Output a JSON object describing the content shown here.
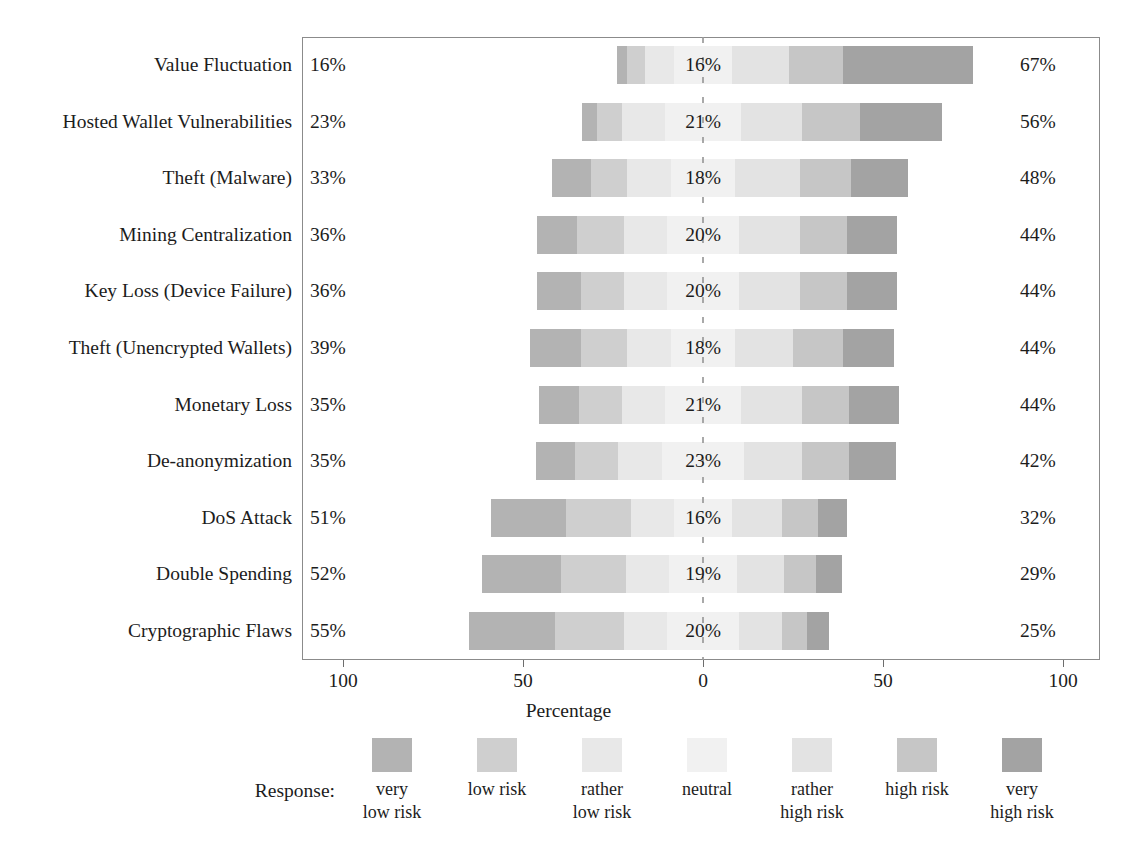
{
  "chart_data": {
    "type": "bar",
    "subtype": "diverging-stacked-likert",
    "title": "",
    "xlabel": "Percentage",
    "ylabel": "",
    "xlim": [
      -100,
      100
    ],
    "xticks": [
      100,
      50,
      0,
      50,
      100
    ],
    "xtick_labels": [
      "100",
      "50",
      "0",
      "50",
      "100"
    ],
    "grid": false,
    "legend_title": "Response:",
    "legend_position": "bottom",
    "zero_reference_line": true,
    "categories_order": [
      "very low risk",
      "low risk",
      "rather low risk",
      "neutral",
      "rather high risk",
      "high risk",
      "very high risk"
    ],
    "category_colors": [
      "#b3b3b3",
      "#cfcfcf",
      "#e8e8e8",
      "#f1f1f1",
      "#e3e3e3",
      "#c6c6c6",
      "#a3a3a3"
    ],
    "summary_columns": {
      "left": "sum of very low risk + low risk + rather low risk",
      "center": "neutral",
      "right": "sum of rather high risk + high risk + very high risk"
    },
    "categories": [
      "Value Fluctuation",
      "Hosted Wallet Vulnerabilities",
      "Theft (Malware)",
      "Mining Centralization",
      "Key Loss (Device Failure)",
      "Theft (Unencrypted Wallets)",
      "Monetary Loss",
      "De-anonymization",
      "DoS Attack",
      "Double Spending",
      "Cryptographic Flaws"
    ],
    "rows": [
      {
        "label": "Value Fluctuation",
        "left_label": "16%",
        "center_label": "16%",
        "right_label": "67%",
        "values": {
          "very low risk": 3,
          "low risk": 5,
          "rather low risk": 8,
          "neutral": 16,
          "rather high risk": 16,
          "high risk": 15,
          "very high risk": 36
        }
      },
      {
        "label": "Hosted Wallet Vulnerabilities",
        "left_label": "23%",
        "center_label": "21%",
        "right_label": "56%",
        "values": {
          "very low risk": 4,
          "low risk": 7,
          "rather low risk": 12,
          "neutral": 21,
          "rather high risk": 17,
          "high risk": 16,
          "very high risk": 23
        }
      },
      {
        "label": "Theft (Malware)",
        "left_label": "33%",
        "center_label": "18%",
        "right_label": "48%",
        "values": {
          "very low risk": 11,
          "low risk": 10,
          "rather low risk": 12,
          "neutral": 18,
          "rather high risk": 18,
          "high risk": 14,
          "very high risk": 16
        }
      },
      {
        "label": "Mining Centralization",
        "left_label": "36%",
        "center_label": "20%",
        "right_label": "44%",
        "values": {
          "very low risk": 11,
          "low risk": 13,
          "rather low risk": 12,
          "neutral": 20,
          "rather high risk": 17,
          "high risk": 13,
          "very high risk": 14
        }
      },
      {
        "label": "Key Loss (Device Failure)",
        "left_label": "36%",
        "center_label": "20%",
        "right_label": "44%",
        "values": {
          "very low risk": 12,
          "low risk": 12,
          "rather low risk": 12,
          "neutral": 20,
          "rather high risk": 17,
          "high risk": 13,
          "very high risk": 14
        }
      },
      {
        "label": "Theft (Unencrypted Wallets)",
        "left_label": "39%",
        "center_label": "18%",
        "right_label": "44%",
        "values": {
          "very low risk": 14,
          "low risk": 13,
          "rather low risk": 12,
          "neutral": 18,
          "rather high risk": 16,
          "high risk": 14,
          "very high risk": 14
        }
      },
      {
        "label": "Monetary Loss",
        "left_label": "35%",
        "center_label": "21%",
        "right_label": "44%",
        "values": {
          "very low risk": 11,
          "low risk": 12,
          "rather low risk": 12,
          "neutral": 21,
          "rather high risk": 17,
          "high risk": 13,
          "very high risk": 14
        }
      },
      {
        "label": "De-anonymization",
        "left_label": "35%",
        "center_label": "23%",
        "right_label": "42%",
        "values": {
          "very low risk": 11,
          "low risk": 12,
          "rather low risk": 12,
          "neutral": 23,
          "rather high risk": 16,
          "high risk": 13,
          "very high risk": 13
        }
      },
      {
        "label": "DoS Attack",
        "left_label": "51%",
        "center_label": "16%",
        "right_label": "32%",
        "values": {
          "very low risk": 21,
          "low risk": 18,
          "rather low risk": 12,
          "neutral": 16,
          "rather high risk": 14,
          "high risk": 10,
          "very high risk": 8
        }
      },
      {
        "label": "Double Spending",
        "left_label": "52%",
        "center_label": "19%",
        "right_label": "29%",
        "values": {
          "very low risk": 22,
          "low risk": 18,
          "rather low risk": 12,
          "neutral": 19,
          "rather high risk": 13,
          "high risk": 9,
          "very high risk": 7
        }
      },
      {
        "label": "Cryptographic Flaws",
        "left_label": "55%",
        "center_label": "20%",
        "right_label": "25%",
        "values": {
          "very low risk": 24,
          "low risk": 19,
          "rather low risk": 12,
          "neutral": 20,
          "rather high risk": 12,
          "high risk": 7,
          "very high risk": 6
        }
      }
    ]
  }
}
